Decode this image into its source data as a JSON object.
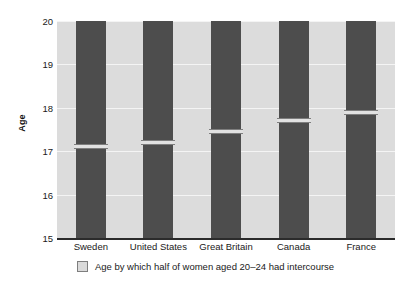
{
  "chart_data": {
    "type": "bar",
    "title": "",
    "subtitle": "",
    "xlabel": "",
    "ylabel": "Age",
    "categories": [
      "Sweden",
      "United States",
      "Great Britain",
      "Canada",
      "France"
    ],
    "values": [
      17.1,
      17.2,
      17.45,
      17.7,
      17.9
    ],
    "series": [
      {
        "name": "Age by which half of women aged 20–24 had intercourse",
        "values": [
          17.1,
          17.2,
          17.45,
          17.7,
          17.9
        ]
      }
    ],
    "ylim": [
      15,
      20
    ],
    "yticks": [
      15,
      16,
      17,
      18,
      19,
      20
    ],
    "ytick_labels": [
      "15",
      "16",
      "17",
      "18",
      "19",
      "20"
    ],
    "bar_top_value": 20,
    "bar_base_value": 15,
    "grid": true,
    "grid_axis": "y",
    "legend": {
      "position": "bottom",
      "entries": [
        "Age by which half of women aged 20–24 had intercourse"
      ]
    },
    "colors": {
      "bar": "#4d4d4d",
      "marker": "#e2e2e2",
      "marker_border": "#7e7e7e",
      "plot_background": "#dcdcdc",
      "gridline": "#f4f4f4",
      "axis": "#2b2b2b",
      "text": "#1a1a1a",
      "page_background": "#ffffff"
    }
  },
  "legend": {
    "label": "Age by which half of women aged 20–24 had intercourse"
  },
  "axes": {
    "y_title": "Age"
  }
}
